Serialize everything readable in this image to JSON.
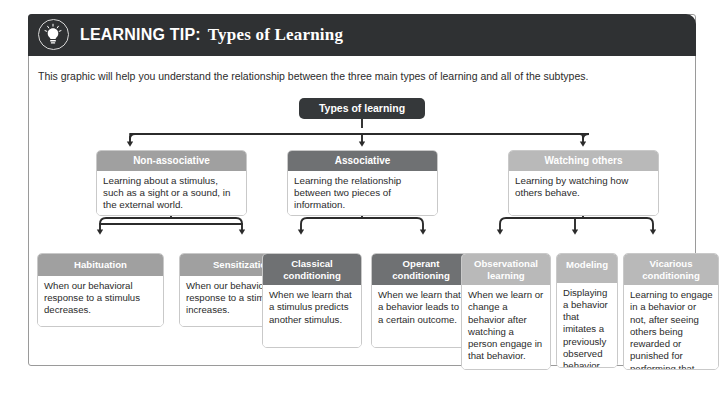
{
  "header": {
    "icon": "lightbulb-icon",
    "label_bold": "LEARNING TIP:",
    "label_serif": "Types of Learning",
    "bg_color": "#2f3133"
  },
  "intro": {
    "text": "This graphic will help you understand the relationship between the three main types of learning and all of the subtypes."
  },
  "diagram": {
    "root": {
      "label": "Types of learning",
      "color": "#35383a"
    },
    "level2": [
      {
        "title": "Non-associative",
        "body": "Learning about a stimulus, such as a sight or a sound, in the external world.",
        "color": "#a0a0a0"
      },
      {
        "title": "Associative",
        "body": "Learning the relationship between two pieces of information.",
        "color": "#6f7173"
      },
      {
        "title": "Watching others",
        "body": "Learning by watching how others behave.",
        "color": "#b9b9b9"
      }
    ],
    "level3": [
      {
        "title": "Habituation",
        "body": "When our behavioral response to a stimulus decreases.",
        "color": "#a0a0a0"
      },
      {
        "title": "Sensitization",
        "body": "When our behavioral response to a stimulus increases.",
        "color": "#a0a0a0"
      },
      {
        "title": "Classical conditioning",
        "body": "When we learn that a stimulus predicts another stimulus.",
        "color": "#6f7173"
      },
      {
        "title": "Operant conditioning",
        "body": "When we learn that a behavior leads to a certain outcome.",
        "color": "#6f7173"
      },
      {
        "title": "Observational learning",
        "body": "When we learn or change a behavior after watching a person engage in that behavior.",
        "color": "#b9b9b9"
      },
      {
        "title": "Modeling",
        "body": "Displaying a behavior that imitates a previously observed behavior.",
        "color": "#b9b9b9"
      },
      {
        "title": "Vicarious conditioning",
        "body": "Learning to engage in a behavior or not, after seeing others being rewarded or punished for performing that action.",
        "color": "#b9b9b9"
      }
    ]
  }
}
